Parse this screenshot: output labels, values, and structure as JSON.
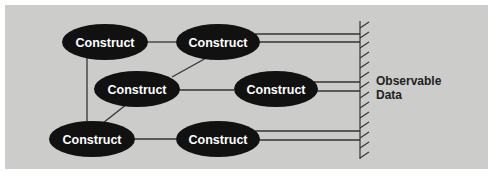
{
  "diagram": {
    "background_color": "#ccccca",
    "node_color": "#111111",
    "line_color": "#333333",
    "nodes": [
      {
        "id": "c1",
        "label": "Construct",
        "cx": 105,
        "cy": 42
      },
      {
        "id": "c2",
        "label": "Construct",
        "cx": 218,
        "cy": 42
      },
      {
        "id": "c3",
        "label": "Construct",
        "cx": 137,
        "cy": 89
      },
      {
        "id": "c4",
        "label": "Construct",
        "cx": 276,
        "cy": 89
      },
      {
        "id": "c5",
        "label": "Construct",
        "cx": 92,
        "cy": 139
      },
      {
        "id": "c6",
        "label": "Construct",
        "cx": 218,
        "cy": 139
      }
    ],
    "edges": [
      {
        "from": "c1",
        "to": "c2"
      },
      {
        "from": "c1",
        "to": "c5"
      },
      {
        "from": "c3",
        "to": "c2"
      },
      {
        "from": "c3",
        "to": "c4"
      },
      {
        "from": "c3",
        "to": "c5"
      },
      {
        "from": "c5",
        "to": "c6"
      }
    ],
    "observation_links": [
      {
        "from": "c2",
        "count": 2
      },
      {
        "from": "c4",
        "count": 2
      },
      {
        "from": "c6",
        "count": 2
      }
    ],
    "observable_label_line1": "Observable",
    "observable_label_line2": "Data"
  }
}
